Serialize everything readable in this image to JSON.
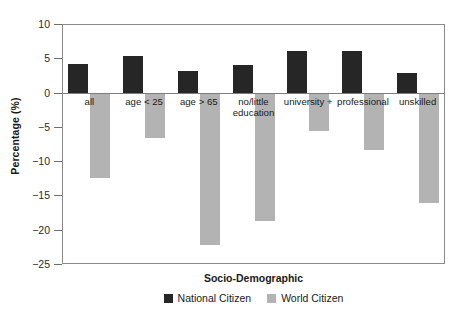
{
  "chart_data": {
    "type": "bar",
    "title": "",
    "xlabel": "Socio-Demographic",
    "ylabel": "Percentage (%)",
    "ylim": [
      -25,
      10
    ],
    "ytick_labels": [
      "10",
      "5",
      "0",
      "-5",
      "-10",
      "-15",
      "-20",
      "-25"
    ],
    "ytick_values": [
      10,
      5,
      0,
      -5,
      -10,
      -15,
      -20,
      -25
    ],
    "grid": false,
    "legend_position": "bottom-center",
    "categories": [
      "all",
      "age < 25",
      "age > 65",
      "no/little\neducation",
      "university +",
      "professional",
      "unskilled"
    ],
    "series": [
      {
        "name": "National Citizen",
        "color": "#262626",
        "values": [
          4.2,
          5.3,
          3.1,
          4.0,
          6.0,
          6.0,
          2.8
        ]
      },
      {
        "name": "World Citizen",
        "color": "#b3b3b3",
        "values": [
          -12.4,
          -6.6,
          -22.2,
          -18.8,
          -5.6,
          -8.4,
          -16.1
        ]
      }
    ]
  },
  "legend": {
    "items": [
      {
        "label": "National Citizen",
        "swatch": "national-swatch"
      },
      {
        "label": "World Citizen",
        "swatch": "world-swatch"
      }
    ]
  }
}
